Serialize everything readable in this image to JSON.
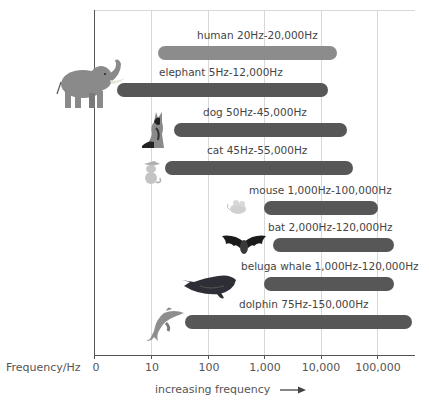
{
  "chart_data": {
    "type": "bar",
    "orientation": "horizontal-range",
    "title": "",
    "xlabel": "increasing frequency",
    "ylabel": "Frequency/Hz",
    "x_scale": "log",
    "x_ticks": [
      "0",
      "10",
      "100",
      "1,000",
      "10,000",
      "100,000"
    ],
    "grid": true,
    "categories": [
      "human",
      "elephant",
      "dog",
      "cat",
      "mouse",
      "bat",
      "beluga whale",
      "dolphin"
    ],
    "series": [
      {
        "name": "min_hz",
        "values": [
          20,
          5,
          50,
          45,
          1000,
          2000,
          1000,
          75
        ]
      },
      {
        "name": "max_hz",
        "values": [
          20000,
          12000,
          45000,
          55000,
          100000,
          120000,
          120000,
          150000
        ]
      }
    ],
    "labels": [
      "human 20Hz-20,000Hz",
      "elephant 5Hz-12,000Hz",
      "dog 50Hz-45,000Hz",
      "cat 45Hz-55,000Hz",
      "mouse 1,000Hz-100,000Hz",
      "bat 2,000Hz-120,000Hz",
      "beluga whale 1,000Hz-120,000Hz",
      "dolphin 75Hz-150,000Hz"
    ],
    "colors": {
      "human": "#8c8c8c",
      "animals": "#575757"
    }
  },
  "axis": {
    "ylabel": "Frequency/Hz",
    "caption": "increasing frequency",
    "ticks": [
      "0",
      "10",
      "100",
      "1,000",
      "10,000",
      "100,000"
    ]
  },
  "bars": [
    {
      "label": "human 20Hz-20,000Hz",
      "left": 158,
      "right": 337,
      "cy": 53,
      "color": "#8c8c8c",
      "lx": 197,
      "animal": "none"
    },
    {
      "label": "elephant 5Hz-12,000Hz",
      "left": 117,
      "right": 328,
      "cy": 90,
      "color": "#575757",
      "lx": 159,
      "animal": "elephant-icon"
    },
    {
      "label": "dog 50Hz-45,000Hz",
      "left": 174,
      "right": 347,
      "cy": 130,
      "color": "#575757",
      "lx": 203,
      "animal": "dog-icon"
    },
    {
      "label": "cat 45Hz-55,000Hz",
      "left": 165,
      "right": 353,
      "cy": 168,
      "color": "#575757",
      "lx": 207,
      "animal": "cat-icon"
    },
    {
      "label": "mouse 1,000Hz-100,000Hz",
      "left": 264,
      "right": 378,
      "cy": 208,
      "color": "#575757",
      "lx": 249,
      "animal": "mouse-icon"
    },
    {
      "label": "bat 2,000Hz-120,000Hz",
      "left": 273,
      "right": 394,
      "cy": 245,
      "color": "#575757",
      "lx": 268,
      "animal": "bat-icon"
    },
    {
      "label": "beluga whale 1,000Hz-120,000Hz",
      "left": 264,
      "right": 394,
      "cy": 284,
      "color": "#575757",
      "lx": 241,
      "animal": "beluga-whale-icon"
    },
    {
      "label": "dolphin 75Hz-150,000Hz",
      "left": 185,
      "right": 412,
      "cy": 322,
      "color": "#575757",
      "lx": 239,
      "animal": "dolphin-icon"
    }
  ]
}
